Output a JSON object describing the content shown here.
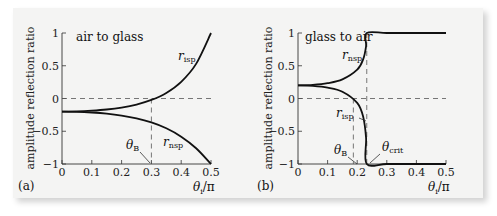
{
  "chart_data": [
    {
      "type": "line",
      "panel_label": "(a)",
      "title": "air to glass",
      "xlabel": "θi/π",
      "ylabel": "amplitude reflection ratio",
      "xlim": [
        0,
        0.5
      ],
      "ylim": [
        -1,
        1
      ],
      "xticks": [
        "0",
        "0.1",
        "0.2",
        "0.3",
        "0.4",
        "0.5"
      ],
      "yticks": [
        "1",
        "0.5",
        "0",
        "−0.5",
        "−1"
      ],
      "x": [
        0,
        0.05,
        0.1,
        0.15,
        0.2,
        0.25,
        0.3,
        0.35,
        0.4,
        0.45,
        0.5
      ],
      "series": [
        {
          "name": "r_isp",
          "values": [
            -0.2,
            -0.197,
            -0.186,
            -0.168,
            -0.138,
            -0.092,
            -0.022,
            0.085,
            0.255,
            0.529,
            1.0
          ]
        },
        {
          "name": "r_nsp",
          "values": [
            -0.2,
            -0.203,
            -0.214,
            -0.232,
            -0.261,
            -0.303,
            -0.366,
            -0.455,
            -0.583,
            -0.759,
            -1.0
          ]
        }
      ],
      "annotations": [
        {
          "label": "θB",
          "x": 0.3,
          "note": "Brewster angle, dashed vertical line"
        }
      ],
      "reference_lines": [
        {
          "type": "horizontal",
          "y": 0,
          "style": "dashed"
        }
      ]
    },
    {
      "type": "line",
      "panel_label": "(b)",
      "title": "glass to air",
      "xlabel": "θi/π",
      "ylabel": "amplitude reflection ratio",
      "xlim": [
        0,
        0.5
      ],
      "ylim": [
        -1,
        1
      ],
      "xticks": [
        "0",
        "0.1",
        "0.2",
        "0.3",
        "0.4",
        "0.5"
      ],
      "yticks": [
        "1",
        "0.5",
        "0",
        "−0.5",
        "−1"
      ],
      "x": [
        0,
        0.05,
        0.1,
        0.15,
        0.2,
        0.22,
        0.23,
        0.2323,
        0.3,
        0.4,
        0.5
      ],
      "series": [
        {
          "name": "r_nsp",
          "values": [
            0.2,
            0.208,
            0.234,
            0.292,
            0.44,
            0.597,
            0.801,
            1.0,
            1.0,
            1.0,
            1.0
          ]
        },
        {
          "name": "r_isp",
          "values": [
            0.2,
            0.192,
            0.166,
            0.104,
            -0.067,
            -0.276,
            -0.602,
            -1.0,
            -1.0,
            -1.0,
            -1.0
          ]
        }
      ],
      "annotations": [
        {
          "label": "θB",
          "x": 0.187,
          "note": "Brewster angle"
        },
        {
          "label": "θcrit",
          "x": 0.2323,
          "note": "critical angle, dashed vertical line"
        }
      ],
      "reference_lines": [
        {
          "type": "horizontal",
          "y": 0,
          "style": "dashed"
        }
      ]
    }
  ],
  "labels": {
    "a": {
      "panel": "(a)",
      "title": "air to glass",
      "ylabel": "amplitude reflection ratio",
      "xlabel_main": "θ",
      "xlabel_sub": "i",
      "xlabel_tail": "/π",
      "risp_main": "r",
      "risp_sub": "isp",
      "rnsp_main": "r",
      "rnsp_sub": "nsp",
      "thetaB_main": "θ",
      "thetaB_sub": "B"
    },
    "b": {
      "panel": "(b)",
      "title": "glass to air",
      "ylabel": "amplitude reflection ratio",
      "xlabel_main": "θ",
      "xlabel_sub": "i",
      "xlabel_tail": "/π",
      "risp_main": "r",
      "risp_sub": "isp",
      "rnsp_main": "r",
      "rnsp_sub": "nsp",
      "thetaB_main": "θ",
      "thetaB_sub": "B",
      "thetacrit_main": "θ",
      "thetacrit_sub": "crit"
    }
  }
}
